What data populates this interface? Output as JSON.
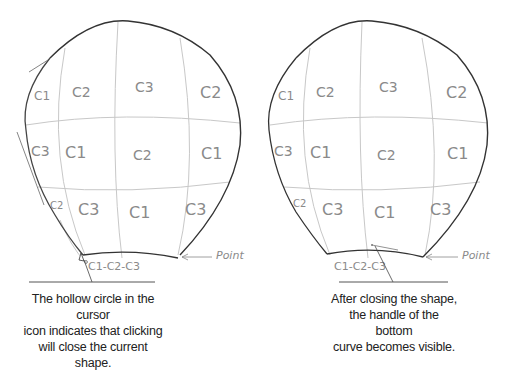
{
  "panels": [
    {
      "name": "before-close",
      "cells": {
        "row1": [
          "C1",
          "C2",
          "C3",
          "C2"
        ],
        "row2": [
          "C3",
          "C1",
          "C2",
          "C1"
        ],
        "row3": [
          "C2",
          "C3",
          "C1",
          "C3"
        ],
        "bottom": "C1-C2-C3"
      },
      "point_label": "Point",
      "caption": [
        "The hollow circle in the cursor",
        "icon indicates that clicking",
        "will close the current shape."
      ]
    },
    {
      "name": "after-close",
      "cells": {
        "row1": [
          "C1",
          "C2",
          "C3",
          "C2"
        ],
        "row2": [
          "C3",
          "C1",
          "C2",
          "C1"
        ],
        "row3": [
          "C2",
          "C3",
          "C1",
          "C3"
        ],
        "bottom": "C1-C2-C3"
      },
      "point_label": "Point",
      "caption": [
        "After closing the shape,",
        "the handle of the bottom",
        "curve becomes visible."
      ]
    }
  ],
  "colors": {
    "outline": "#333333",
    "sketch": "#bdbdbd",
    "sketch_text": "#8a8a8a",
    "rule": "#555555"
  }
}
